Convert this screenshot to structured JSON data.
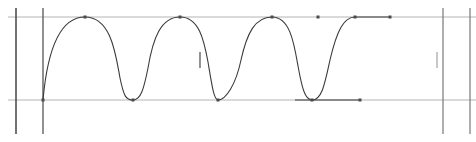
{
  "canvas": {
    "width": 476,
    "height": 142,
    "background_color": "#ffffff",
    "title": "Curve Editor Canvas"
  },
  "colors": {
    "curve_stroke": "#3a3a3a",
    "gridline": "#b4b4b4",
    "guide_line": "#555555",
    "anchor_point": "#4a4a4a",
    "handle_line": "#4a4a4a",
    "flat_segment": "#3a3a3a"
  },
  "geometry": {
    "curve_stroke_width": 1.1,
    "gridline_stroke_width": 1,
    "guide_stroke_width": 1.4,
    "anchor_size": 3
  },
  "chart_data": {
    "type": "line",
    "title": "",
    "subtitle": "",
    "xlabel": "",
    "ylabel": "",
    "grid": true,
    "legend_position": "none",
    "xlim": [
      0,
      476
    ],
    "ylim": [
      142,
      0
    ],
    "value_levels": {
      "high_label": "max",
      "high_y": 17,
      "low_label": "min",
      "low_y": 100
    },
    "series": [
      {
        "name": "value-curve",
        "x": [
          43,
          85,
          133,
          180,
          218,
          272,
          312,
          355,
          390
        ],
        "y": [
          100,
          17,
          100,
          17,
          100,
          17,
          100,
          17,
          17
        ]
      }
    ]
  },
  "gridlines": [
    {
      "id": "gridline-high",
      "orientation": "horizontal",
      "position": 17,
      "start": 8,
      "end": 476
    },
    {
      "id": "gridline-low",
      "orientation": "horizontal",
      "position": 100,
      "start": 8,
      "end": 476
    }
  ],
  "guides": [
    {
      "id": "guide-left-outer",
      "orientation": "vertical",
      "position": 16,
      "start": 8,
      "end": 134
    },
    {
      "id": "guide-left-inner",
      "orientation": "vertical",
      "position": 43,
      "start": 8,
      "end": 134
    },
    {
      "id": "guide-right-inner",
      "orientation": "vertical",
      "position": 443,
      "start": 8,
      "end": 134
    },
    {
      "id": "guide-right-outer",
      "orientation": "vertical",
      "position": 470,
      "start": 8,
      "end": 134
    }
  ],
  "curve_path": "M 43,100 C 47,55 58,17 85,17 C 112,17 116,57 120,78 C 124,97 126,100 133,100 C 141,100 144,88 148,68 C 153,38 161,17 180,17 C 199,17 204,40 208,62 C 212,86 214,100 218,100 C 226,100 236,84 241,60 C 247,33 255,17 272,17 C 290,17 294,43 298,66 C 302,88 305,100 312,100 C 322,100 325,83 330,60 C 337,30 344,17 355,17 L 390,17",
  "flat_segments": [
    {
      "id": "flat-top-hold",
      "x1": 355,
      "y1": 17,
      "x2": 390,
      "y2": 17
    },
    {
      "id": "flat-bottom-hold",
      "x1": 295,
      "y1": 100,
      "x2": 360,
      "y2": 100
    }
  ],
  "anchor_points": [
    {
      "id": "anchor-start",
      "label": "start",
      "x": 43,
      "y": 100,
      "type": "anchor"
    },
    {
      "id": "anchor-peak-1",
      "label": "peak 1",
      "x": 85,
      "y": 17,
      "type": "anchor"
    },
    {
      "id": "anchor-trough-1",
      "label": "trough 1",
      "x": 133,
      "y": 100,
      "type": "anchor"
    },
    {
      "id": "anchor-peak-2",
      "label": "peak 2",
      "x": 180,
      "y": 17,
      "type": "anchor"
    },
    {
      "id": "anchor-trough-2",
      "label": "trough 2",
      "x": 218,
      "y": 100,
      "type": "anchor"
    },
    {
      "id": "anchor-peak-3",
      "label": "peak 3",
      "x": 272,
      "y": 17,
      "type": "anchor"
    },
    {
      "id": "anchor-trough-3",
      "label": "trough 3",
      "x": 312,
      "y": 100,
      "type": "anchor"
    },
    {
      "id": "anchor-peak-4",
      "label": "peak 4",
      "x": 355,
      "y": 17,
      "type": "anchor"
    },
    {
      "id": "anchor-end",
      "label": "end",
      "x": 390,
      "y": 17,
      "type": "anchor"
    },
    {
      "id": "anchor-hold-mid",
      "label": "hold mid",
      "x": 318,
      "y": 17,
      "type": "anchor"
    },
    {
      "id": "anchor-bottom-end",
      "label": "bottom end",
      "x": 360,
      "y": 100,
      "type": "anchor"
    }
  ],
  "handles": [
    {
      "id": "handle-mid-left",
      "x": 200,
      "y": 60,
      "length": 16,
      "orientation": "vertical"
    },
    {
      "id": "handle-mid-right",
      "x": 437,
      "y": 60,
      "length": 16,
      "orientation": "vertical"
    }
  ]
}
